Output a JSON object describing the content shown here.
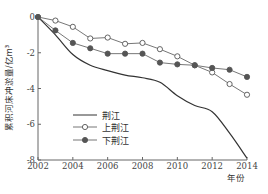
{
  "chart_data": {
    "type": "line",
    "title": "",
    "xlabel": "年份",
    "ylabel": "累积河床冲淤量/亿m³",
    "xlim": [
      2002,
      2014
    ],
    "ylim": [
      -8,
      0
    ],
    "x_ticks": [
      2002,
      2004,
      2006,
      2008,
      2010,
      2012,
      2014
    ],
    "y_ticks": [
      0,
      -2,
      -4,
      -6,
      -8
    ],
    "grid": false,
    "legend_position": "lower-left inside",
    "x": [
      2002,
      2003,
      2004,
      2005,
      2006,
      2007,
      2008,
      2009,
      2010,
      2011,
      2012,
      2013,
      2014
    ],
    "series": [
      {
        "name": "荆江",
        "marker": "none",
        "values": [
          0,
          -1.0,
          -2.1,
          -2.7,
          -3.0,
          -3.25,
          -3.4,
          -3.65,
          -4.4,
          -4.95,
          -5.3,
          -6.5,
          -7.9
        ]
      },
      {
        "name": "上荆江",
        "marker": "open-circle",
        "values": [
          0,
          -0.2,
          -0.55,
          -1.2,
          -1.15,
          -1.5,
          -1.45,
          -1.8,
          -2.2,
          -2.7,
          -3.1,
          -3.75,
          -4.35
        ]
      },
      {
        "name": "下荆江",
        "marker": "filled-circle",
        "values": [
          0,
          -0.75,
          -1.45,
          -1.75,
          -2.05,
          -2.05,
          -2.05,
          -2.55,
          -2.65,
          -2.7,
          -2.85,
          -2.95,
          -3.35
        ]
      }
    ]
  },
  "labels": {
    "y_axis_title": "累积河床冲淤量/亿m³",
    "x_axis_title": "年份",
    "legend": [
      "荆江",
      "上荆江",
      "下荆江"
    ]
  }
}
